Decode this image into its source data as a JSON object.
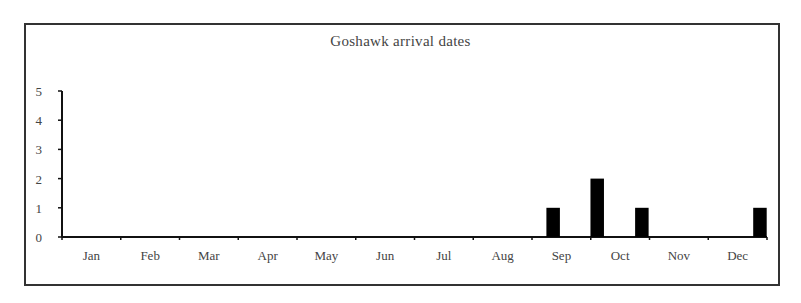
{
  "chart_data": {
    "type": "bar",
    "title": "Goshawk arrival dates",
    "xlabel": "",
    "ylabel": "",
    "ylim": [
      0,
      5
    ],
    "yticks": [
      0,
      1,
      2,
      3,
      4,
      5
    ],
    "categories": [
      "Jan",
      "Feb",
      "Mar",
      "Apr",
      "May",
      "Jun",
      "Jul",
      "Aug",
      "Sep",
      "Oct",
      "Nov",
      "Dec"
    ],
    "bars": [
      {
        "month": "Sep",
        "position_months": 8.36,
        "value": 1
      },
      {
        "month": "Oct",
        "position_months": 9.11,
        "value": 2
      },
      {
        "month": "Oct",
        "position_months": 9.87,
        "value": 1
      },
      {
        "month": "Dec",
        "position_months": 11.88,
        "value": 1
      }
    ],
    "monthly_totals": {
      "Jan": 0,
      "Feb": 0,
      "Mar": 0,
      "Apr": 0,
      "May": 0,
      "Jun": 0,
      "Jul": 0,
      "Aug": 0,
      "Sep": 1,
      "Oct": 3,
      "Nov": 0,
      "Dec": 1
    },
    "grid": false,
    "legend": null,
    "bar_color": "#000000"
  }
}
